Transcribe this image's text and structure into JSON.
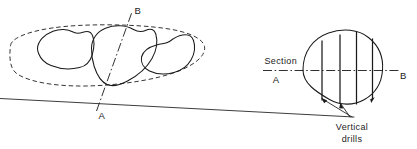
{
  "figure": {
    "background_color": "#ffffff",
    "line_color": "#1a1a1a"
  },
  "plan_view": {
    "name": "plan-view",
    "section_line_label_top": "B",
    "section_line_label_bottom": "A",
    "envelope_style": "dashed",
    "blob_count": 3,
    "blobs": [
      {
        "name": "orebody-lobe-left"
      },
      {
        "name": "orebody-lobe-center"
      },
      {
        "name": "orebody-lobe-right"
      }
    ]
  },
  "section_view": {
    "name": "section-view",
    "section_label_line1": "Section",
    "section_label_line2": "A",
    "section_label_right": "B",
    "drill_count": 4,
    "annotation_line1": "Vertical",
    "annotation_line2": "drills",
    "arrow_count": 3
  }
}
